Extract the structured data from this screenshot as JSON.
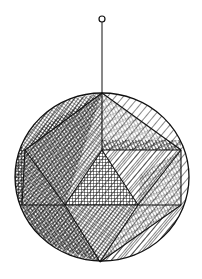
{
  "figure": {
    "colors": {
      "background": "#ffffff",
      "ink": "#111111"
    },
    "ring": {
      "cx": 102,
      "cy": 19,
      "r": 3
    },
    "string": {
      "x": 102,
      "y1": 22,
      "y2": 93
    },
    "sphere": {
      "cx": 102,
      "cy": 177,
      "rx": 87,
      "ry": 84
    }
  }
}
